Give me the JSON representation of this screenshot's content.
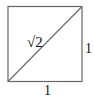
{
  "diagram": {
    "type": "unit-square-with-diagonal",
    "labels": {
      "diagonal": "√2",
      "right_side": "1",
      "bottom_side": "1"
    },
    "colors": {
      "stroke": "#555555",
      "text": "#111111",
      "background": "#ffffff"
    }
  }
}
